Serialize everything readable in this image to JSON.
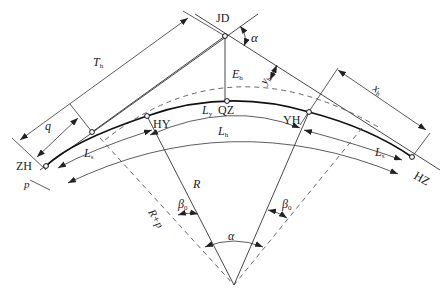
{
  "diagram": {
    "points": [
      {
        "id": "JD",
        "label": "JD"
      },
      {
        "id": "ZH",
        "label": "ZH"
      },
      {
        "id": "HY",
        "label": "HY"
      },
      {
        "id": "QZ",
        "label": "QZ"
      },
      {
        "id": "YH",
        "label": "YH"
      },
      {
        "id": "HZ",
        "label": "HZ"
      }
    ],
    "labels": {
      "alpha_top": "α",
      "alpha_center": "α",
      "T": "T",
      "T_sub": "h",
      "q": "q",
      "p": "p",
      "E": "E",
      "E_sub": "h",
      "y": "y",
      "y_sub": "h",
      "x": "x",
      "x_sub": "h",
      "Ly": "L",
      "Ly_sub": "y",
      "Lh": "L",
      "Lh_sub": "h",
      "Ls_left": "L",
      "Ls_right": "L",
      "Ls_sub": "s",
      "R": "R",
      "Rp": "R+p",
      "beta_left": "β",
      "beta_right": "β",
      "beta_sub": "0"
    },
    "colors": {
      "line": "#333333",
      "curve": "#111111",
      "dash": "#555555"
    }
  }
}
